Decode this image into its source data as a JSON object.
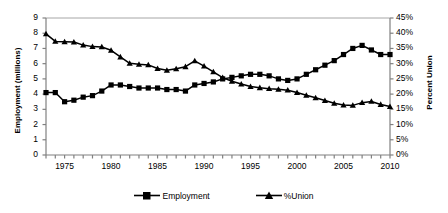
{
  "chart_data": {
    "type": "line",
    "title": "",
    "xlabel": "",
    "ylabel": "Employment (millions)",
    "ylabel_right": "Percent Union",
    "grid": false,
    "legend_position": "bottom",
    "xlim": [
      1973,
      2010
    ],
    "ylim": [
      0,
      9
    ],
    "ylim_right": [
      0,
      45
    ],
    "x": [
      1973,
      1974,
      1975,
      1976,
      1977,
      1978,
      1979,
      1980,
      1981,
      1982,
      1983,
      1984,
      1985,
      1986,
      1987,
      1988,
      1989,
      1990,
      1991,
      1992,
      1993,
      1994,
      1995,
      1996,
      1997,
      1998,
      1999,
      2000,
      2001,
      2002,
      2003,
      2004,
      2005,
      2006,
      2007,
      2008,
      2009,
      2010
    ],
    "series": [
      {
        "name": "Employment",
        "axis": "left",
        "unit": "millions",
        "marker": "square",
        "values": [
          4.1,
          4.1,
          3.5,
          3.6,
          3.8,
          3.9,
          4.2,
          4.6,
          4.6,
          4.5,
          4.4,
          4.4,
          4.4,
          4.3,
          4.3,
          4.2,
          4.6,
          4.7,
          4.8,
          5.0,
          5.1,
          5.2,
          5.3,
          5.3,
          5.2,
          5.0,
          4.9,
          5.0,
          5.3,
          5.6,
          5.9,
          6.2,
          6.6,
          7.0,
          7.2,
          6.9,
          6.6,
          6.6
        ]
      },
      {
        "name": "%Union",
        "axis": "right",
        "unit": "percent",
        "marker": "triangle",
        "values": [
          39.8,
          37.3,
          37.2,
          37.1,
          36.1,
          35.6,
          35.5,
          34.4,
          32.2,
          30.1,
          29.8,
          29.6,
          28.4,
          27.8,
          28.3,
          29.0,
          30.9,
          29.2,
          27.3,
          25.4,
          24.2,
          23.3,
          22.5,
          22.1,
          21.8,
          21.6,
          21.3,
          20.5,
          19.6,
          18.8,
          17.9,
          17.0,
          16.4,
          16.3,
          17.2,
          17.6,
          16.6,
          15.9
        ]
      }
    ],
    "y_ticks_left": [
      0,
      1,
      2,
      3,
      4,
      5,
      6,
      7,
      8,
      9
    ],
    "y_tick_labels_left": [
      "0",
      "1",
      "2",
      "3",
      "4",
      "5",
      "6",
      "7",
      "8",
      "9"
    ],
    "y_ticks_right": [
      0,
      5,
      10,
      15,
      20,
      25,
      30,
      35,
      40,
      45
    ],
    "y_tick_labels_right": [
      "0%",
      "5%",
      "10%",
      "15%",
      "20%",
      "25%",
      "30%",
      "35%",
      "40%",
      "45%"
    ],
    "x_tick_labels": [
      "1975",
      "1980",
      "1985",
      "1990",
      "1995",
      "2000",
      "2005",
      "2010"
    ],
    "x_tick_values": [
      1975,
      1980,
      1985,
      1990,
      1995,
      2000,
      2005,
      2010
    ],
    "colors": {
      "series": "#000000",
      "axis": "#808080",
      "top_border": "#a6a6a6",
      "background": "#ffffff"
    }
  },
  "legend": {
    "items": [
      {
        "label": "Employment",
        "marker": "square"
      },
      {
        "label": "%Union",
        "marker": "triangle"
      }
    ]
  }
}
